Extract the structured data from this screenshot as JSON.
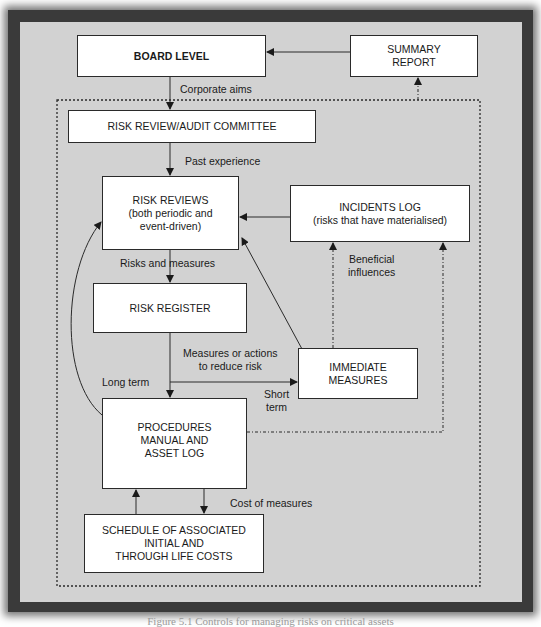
{
  "diagram": {
    "boxes": {
      "board_level": "BOARD LEVEL",
      "summary_report": "SUMMARY\nREPORT",
      "risk_review_committee": "RISK REVIEW/AUDIT COMMITTEE",
      "risk_reviews": "RISK REVIEWS\n(both periodic and\nevent-driven)",
      "incidents_log": "INCIDENTS LOG\n(risks that have materialised)",
      "risk_register": "RISK REGISTER",
      "immediate_measures": "IMMEDIATE\nMEASURES",
      "procedures_manual": "PROCEDURES\nMANUAL AND\nASSET LOG",
      "schedule_costs": "SCHEDULE OF ASSOCIATED\nINITIAL AND\nTHROUGH LIFE COSTS"
    },
    "edge_labels": {
      "corporate_aims": "Corporate aims",
      "past_experience": "Past experience",
      "risks_and_measures": "Risks and measures",
      "beneficial_influences": "Beneficial\ninfluences",
      "measures_or_actions": "Measures or actions\nto reduce risk",
      "long_term": "Long term",
      "short_term": "Short\nterm",
      "cost_of_measures": "Cost of measures"
    },
    "colors": {
      "panel": "#d2d2d2",
      "frame": "#3a3a3a",
      "box_fill": "#ffffff",
      "line": "#2a2a2a"
    }
  },
  "caption": "Figure 5.1 Controls for managing risks on critical assets"
}
